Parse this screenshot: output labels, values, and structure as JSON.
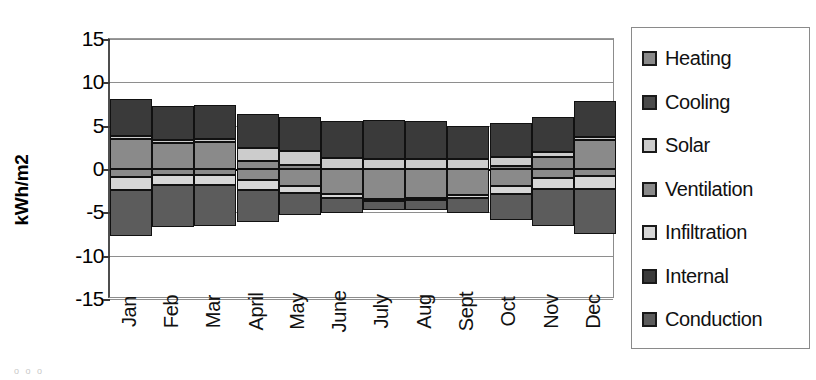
{
  "chart_data": {
    "type": "bar",
    "subtype": "stacked-bar-positive-negative",
    "title": "",
    "xlabel": "",
    "ylabel": "kWh/m2",
    "ylim": [
      -15,
      15
    ],
    "yticks": [
      15,
      10,
      5,
      0,
      -5,
      -10,
      -15
    ],
    "ytick_labels": [
      "15",
      "10",
      "5",
      "0",
      "-5",
      "-10",
      "-15"
    ],
    "grid": true,
    "legend_position": "right",
    "categories": [
      "Jan",
      "Feb",
      "Mar",
      "April",
      "May",
      "June",
      "July",
      "Aug",
      "Sept",
      "Oct",
      "Nov",
      "Dec"
    ],
    "series": [
      {
        "name": "Heating",
        "color": "#8a8a8a",
        "values": [
          3.5,
          3.0,
          3.1,
          0.9,
          0.5,
          0.0,
          0.0,
          0.0,
          0.0,
          0.3,
          1.4,
          3.3
        ]
      },
      {
        "name": "Cooling",
        "color": "#4a4a4a",
        "values": [
          0.0,
          0.0,
          0.0,
          0.0,
          0.0,
          0.0,
          0.0,
          0.0,
          0.0,
          0.0,
          0.0,
          0.0
        ]
      },
      {
        "name": "Solar",
        "color": "#cccccc",
        "values": [
          0.35,
          0.4,
          0.4,
          1.5,
          1.6,
          1.3,
          1.2,
          1.2,
          1.1,
          1.1,
          0.6,
          0.35
        ]
      },
      {
        "name": "Ventilation",
        "color": "#8a8a8a",
        "values": [
          -0.9,
          -0.7,
          -0.7,
          -1.3,
          -2.0,
          -2.9,
          -3.5,
          -3.4,
          -3.0,
          -2.0,
          -1.0,
          -0.8
        ]
      },
      {
        "name": "Infiltration",
        "color": "#d6d6d6",
        "values": [
          -1.5,
          -1.2,
          -1.2,
          -1.1,
          -0.8,
          -0.5,
          -0.2,
          -0.2,
          -0.3,
          -0.9,
          -1.3,
          -1.5
        ]
      },
      {
        "name": "Internal",
        "color": "#3a3a3a",
        "values": [
          4.2,
          3.9,
          3.9,
          4.0,
          3.9,
          4.2,
          4.4,
          4.3,
          3.9,
          3.9,
          4.0,
          4.2
        ]
      },
      {
        "name": "Conduction",
        "color": "#5c5c5c",
        "values": [
          -5.3,
          -4.8,
          -4.7,
          -3.7,
          -2.5,
          -1.7,
          -1.0,
          -1.1,
          -1.8,
          -3.0,
          -4.3,
          -5.2
        ]
      }
    ],
    "stack_totals_positive": [
      8.05,
      7.3,
      7.4,
      6.4,
      6.0,
      5.5,
      5.6,
      5.5,
      5.0,
      5.3,
      6.0,
      7.85
    ],
    "stack_totals_negative": [
      -7.7,
      -6.7,
      -6.6,
      -6.1,
      -5.3,
      -5.1,
      -4.7,
      -4.7,
      -5.1,
      -5.9,
      -6.6,
      -7.5
    ]
  },
  "axis": {
    "y_title": "kWh/m2",
    "tick_labels": [
      "15",
      "10",
      "5",
      "0",
      "-5",
      "-10",
      "-15"
    ],
    "category_labels": [
      "Jan",
      "Feb",
      "Mar",
      "April",
      "May",
      "June",
      "July",
      "Aug",
      "Sept",
      "Oct",
      "Nov",
      "Dec"
    ]
  },
  "legend": {
    "items": [
      {
        "label": "Heating",
        "color": "#8a8a8a"
      },
      {
        "label": "Cooling",
        "color": "#4a4a4a"
      },
      {
        "label": "Solar",
        "color": "#cccccc"
      },
      {
        "label": "Ventilation",
        "color": "#8a8a8a"
      },
      {
        "label": "Infiltration",
        "color": "#d6d6d6"
      },
      {
        "label": "Internal",
        "color": "#3a3a3a"
      },
      {
        "label": "Conduction",
        "color": "#5c5c5c"
      }
    ]
  },
  "artifact": {
    "text": "o o o"
  }
}
